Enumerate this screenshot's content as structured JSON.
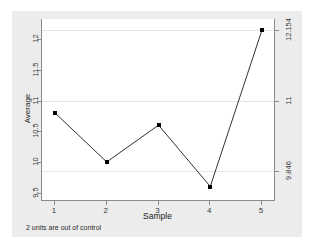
{
  "chart_data": {
    "type": "line",
    "title": "",
    "subtitle": "",
    "xlabel": "Sample",
    "ylabel": "Average",
    "x": [
      1,
      2,
      3,
      4,
      5
    ],
    "categories": [
      "1",
      "2",
      "3",
      "4",
      "5"
    ],
    "values": [
      10.8,
      10.0,
      10.6,
      9.6,
      12.154
    ],
    "series": [
      {
        "name": "Average",
        "values": [
          10.8,
          10.0,
          10.6,
          9.6,
          12.154
        ]
      }
    ],
    "xlim": [
      0.75,
      5.25
    ],
    "ylim": [
      9.38,
      12.33
    ],
    "grid": true,
    "gridlines": [
      12.154,
      11,
      9.846
    ],
    "legend": "none",
    "marker": "filled-square",
    "line_color": "#1a1a1a",
    "marker_color": "#000000",
    "grid_color": "#e4e4ec",
    "panel_background": "#ececec",
    "plot_background": "#ffffff",
    "y_ticks": [
      {
        "value": 9.5,
        "label": "9.5"
      },
      {
        "value": 10,
        "label": "10"
      },
      {
        "value": 10.5,
        "label": "10.5"
      },
      {
        "value": 11,
        "label": "11"
      },
      {
        "value": 11.5,
        "label": "11.5"
      },
      {
        "value": 12,
        "label": "12"
      }
    ],
    "x_ticks": [
      {
        "value": 1,
        "label": "1"
      },
      {
        "value": 2,
        "label": "2"
      },
      {
        "value": 3,
        "label": "3"
      },
      {
        "value": 4,
        "label": "4"
      },
      {
        "value": 5,
        "label": "5"
      }
    ],
    "control_limits": [
      {
        "name": "upper-control-limit",
        "value": 12.154,
        "label": "12.154"
      },
      {
        "name": "center-line",
        "value": 11,
        "label": "11"
      },
      {
        "name": "lower-control-limit",
        "value": 9.846,
        "label": "9.846"
      }
    ],
    "annotation": "2 units are out of control"
  },
  "axes": {
    "y_title": "Average",
    "x_title": "Sample"
  },
  "footnote": {
    "text": "2 units are out of control"
  }
}
